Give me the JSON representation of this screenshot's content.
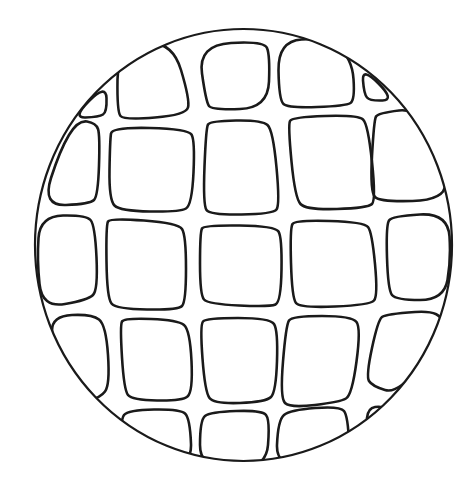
{
  "figure": {
    "title": "",
    "canvas": {
      "width": 470,
      "height": 495,
      "background": "#ffffff"
    },
    "stroke_color": "#1a1a1a",
    "circle": {
      "cx": 243.5,
      "cy": 245,
      "rx": 208.5,
      "ry": 216,
      "stroke_width": 2.2
    },
    "cell_stroke_width": 2.6,
    "cells": [
      {
        "row": 1,
        "pts": [
          [
            72,
            118
          ],
          [
            106,
            84
          ],
          [
            107,
            112
          ],
          [
            99,
            117
          ]
        ]
      },
      {
        "row": 1,
        "pts": [
          [
            118,
            47
          ],
          [
            172,
            40
          ],
          [
            190,
            100
          ],
          [
            186,
            115
          ],
          [
            124,
            120
          ],
          [
            117,
            112
          ]
        ]
      },
      {
        "row": 1,
        "pts": [
          [
            198,
            45
          ],
          [
            264,
            41
          ],
          [
            270,
            55
          ],
          [
            268,
            108
          ],
          [
            212,
            110
          ],
          [
            206,
            102
          ]
        ]
      },
      {
        "row": 1,
        "pts": [
          [
            278,
            41
          ],
          [
            325,
            38
          ],
          [
            352,
            58
          ],
          [
            355,
            100
          ],
          [
            346,
            106
          ],
          [
            288,
            108
          ],
          [
            279,
            100
          ]
        ]
      },
      {
        "row": 1,
        "pts": [
          [
            362,
            67
          ],
          [
            395,
            100
          ],
          [
            370,
            101
          ],
          [
            364,
            94
          ]
        ]
      },
      {
        "row": 2,
        "pts": [
          [
            78,
            120
          ],
          [
            96,
            123
          ],
          [
            100,
            135
          ],
          [
            98,
            196
          ],
          [
            90,
            204
          ],
          [
            42,
            206
          ],
          [
            60,
            150
          ]
        ]
      },
      {
        "row": 2,
        "pts": [
          [
            112,
            127
          ],
          [
            188,
            129
          ],
          [
            195,
            140
          ],
          [
            192,
            205
          ],
          [
            180,
            212
          ],
          [
            120,
            211
          ],
          [
            109,
            200
          ],
          [
            110,
            140
          ]
        ]
      },
      {
        "row": 2,
        "pts": [
          [
            210,
            121
          ],
          [
            262,
            120
          ],
          [
            273,
            130
          ],
          [
            280,
            205
          ],
          [
            273,
            214
          ],
          [
            210,
            215
          ],
          [
            203,
            205
          ],
          [
            206,
            128
          ]
        ]
      },
      {
        "row": 2,
        "pts": [
          [
            292,
            117
          ],
          [
            358,
            115
          ],
          [
            368,
            124
          ],
          [
            376,
            200
          ],
          [
            368,
            208
          ],
          [
            306,
            210
          ],
          [
            295,
            198
          ],
          [
            288,
            125
          ]
        ]
      },
      {
        "row": 2,
        "pts": [
          [
            378,
            113
          ],
          [
            420,
            108
          ],
          [
            446,
            168
          ],
          [
            445,
            200
          ],
          [
            380,
            202
          ],
          [
            370,
            192
          ],
          [
            374,
            120
          ]
        ]
      },
      {
        "row": 3,
        "pts": [
          [
            40,
            216
          ],
          [
            86,
            215
          ],
          [
            95,
            225
          ],
          [
            98,
            290
          ],
          [
            88,
            300
          ],
          [
            42,
            308
          ],
          [
            37,
            260
          ]
        ]
      },
      {
        "row": 3,
        "pts": [
          [
            110,
            218
          ],
          [
            178,
            223
          ],
          [
            186,
            235
          ],
          [
            186,
            302
          ],
          [
            178,
            310
          ],
          [
            116,
            309
          ],
          [
            107,
            298
          ],
          [
            106,
            225
          ]
        ]
      },
      {
        "row": 3,
        "pts": [
          [
            204,
            225
          ],
          [
            275,
            226
          ],
          [
            282,
            237
          ],
          [
            281,
            302
          ],
          [
            270,
            307
          ],
          [
            208,
            304
          ],
          [
            200,
            295
          ],
          [
            200,
            232
          ]
        ]
      },
      {
        "row": 3,
        "pts": [
          [
            295,
            220
          ],
          [
            364,
            222
          ],
          [
            372,
            232
          ],
          [
            378,
            296
          ],
          [
            370,
            305
          ],
          [
            300,
            308
          ],
          [
            292,
            298
          ],
          [
            290,
            228
          ]
        ]
      },
      {
        "row": 3,
        "pts": [
          [
            392,
            216
          ],
          [
            448,
            213
          ],
          [
            451,
            260
          ],
          [
            444,
            300
          ],
          [
            396,
            300
          ],
          [
            388,
            290
          ],
          [
            386,
            225
          ]
        ]
      },
      {
        "row": 4,
        "pts": [
          [
            52,
            316
          ],
          [
            92,
            314
          ],
          [
            106,
            325
          ],
          [
            110,
            385
          ],
          [
            100,
            398
          ],
          [
            82,
            400
          ],
          [
            52,
            345
          ]
        ]
      },
      {
        "row": 4,
        "pts": [
          [
            124,
            318
          ],
          [
            178,
            320
          ],
          [
            190,
            330
          ],
          [
            193,
            392
          ],
          [
            182,
            401
          ],
          [
            132,
            400
          ],
          [
            124,
            390
          ],
          [
            120,
            325
          ]
        ]
      },
      {
        "row": 4,
        "pts": [
          [
            206,
            318
          ],
          [
            270,
            318
          ],
          [
            278,
            330
          ],
          [
            276,
            392
          ],
          [
            266,
            402
          ],
          [
            214,
            404
          ],
          [
            205,
            392
          ],
          [
            200,
            325
          ]
        ]
      },
      {
        "row": 4,
        "pts": [
          [
            292,
            316
          ],
          [
            352,
            316
          ],
          [
            361,
            328
          ],
          [
            352,
            395
          ],
          [
            340,
            402
          ],
          [
            290,
            408
          ],
          [
            280,
            398
          ],
          [
            286,
            325
          ]
        ]
      },
      {
        "row": 4,
        "pts": [
          [
            386,
            314
          ],
          [
            444,
            310
          ],
          [
            440,
            340
          ],
          [
            398,
            394
          ],
          [
            372,
            386
          ],
          [
            366,
            376
          ],
          [
            378,
            320
          ]
        ]
      },
      {
        "row": 5,
        "pts": [
          [
            128,
            410
          ],
          [
            180,
            409
          ],
          [
            190,
            418
          ],
          [
            192,
            470
          ],
          [
            126,
            470
          ],
          [
            120,
            420
          ]
        ]
      },
      {
        "row": 5,
        "pts": [
          [
            210,
            412
          ],
          [
            262,
            410
          ],
          [
            270,
            420
          ],
          [
            266,
            470
          ],
          [
            200,
            470
          ],
          [
            200,
            420
          ]
        ]
      },
      {
        "row": 5,
        "pts": [
          [
            290,
            410
          ],
          [
            340,
            406
          ],
          [
            348,
            416
          ],
          [
            350,
            470
          ],
          [
            276,
            470
          ],
          [
            278,
            420
          ]
        ]
      },
      {
        "row": 5,
        "pts": [
          [
            368,
            408
          ],
          [
            382,
            406
          ],
          [
            392,
            412
          ],
          [
            366,
            428
          ]
        ]
      }
    ]
  }
}
